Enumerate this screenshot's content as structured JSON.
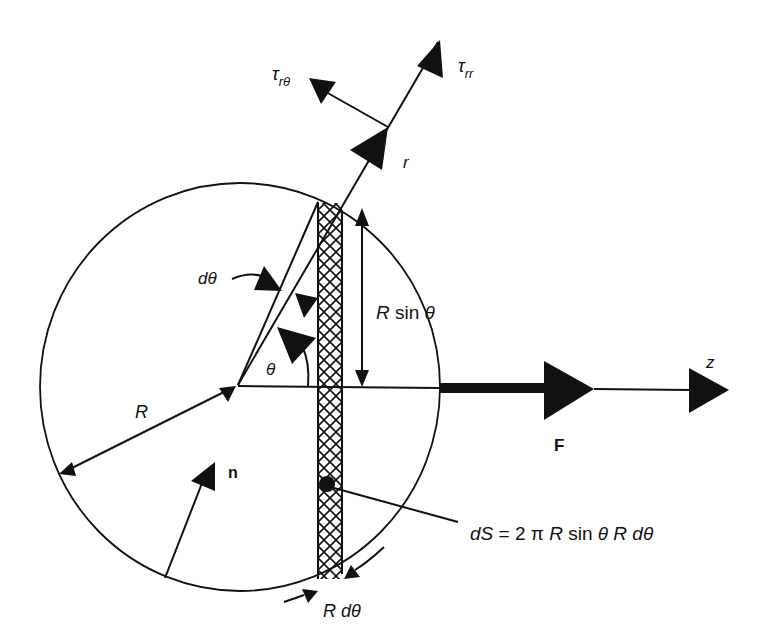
{
  "figure": {
    "colors": {
      "ink": "#111111",
      "background": "#ffffff"
    }
  },
  "labels": {
    "tau_rtheta": {
      "base": "τ",
      "sub": "rθ"
    },
    "tau_rr": {
      "base": "τ",
      "sub": "rr"
    },
    "r": "r",
    "dtheta": "dθ",
    "r_sin_theta": "R sin θ",
    "theta": "θ",
    "z": "z",
    "R": "R",
    "F": "F",
    "n": "n",
    "dS": "dS = 2 π R sin θ R dθ",
    "r_dtheta": "R dθ"
  }
}
